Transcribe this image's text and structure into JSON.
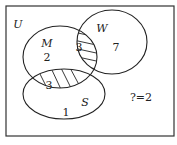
{
  "diagram": {
    "type": "venn",
    "universe_label": "U",
    "sets": [
      {
        "name": "M",
        "label": "M"
      },
      {
        "name": "W",
        "label": "W"
      },
      {
        "name": "S",
        "label": "S"
      }
    ],
    "regions": {
      "m_only": "2",
      "m_and_w": "3",
      "w_only": "7",
      "m_and_s": "3",
      "s_only": "1"
    },
    "outside_note": "?=2",
    "shaded_regions": [
      "M∩W",
      "M∩S"
    ],
    "colors": {
      "stroke": "#222222",
      "background": "#ffffff"
    }
  }
}
